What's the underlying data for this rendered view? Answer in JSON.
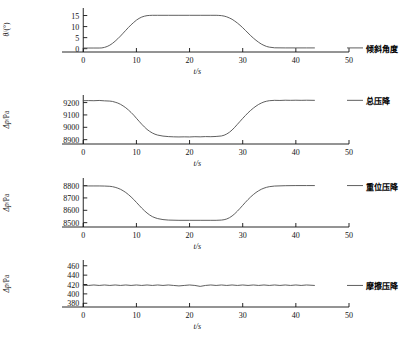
{
  "figure": {
    "title": "",
    "axis_x_label": "t/s",
    "x_ticks": [
      0,
      10,
      20,
      30,
      40,
      50
    ],
    "x_range": [
      -4,
      50
    ]
  },
  "panels": [
    {
      "key": "inclination",
      "ylabel_main": "θ",
      "ylabel_unit": "/(°)",
      "ylabel_full": "θ/(°)",
      "series_label": "倾斜角度",
      "y_ticks": [
        0,
        5,
        10,
        15
      ],
      "y_range": [
        -1.5,
        17.5
      ],
      "xlabel": "t/s"
    },
    {
      "key": "total-pressure-drop",
      "ylabel_main": "Δp",
      "ylabel_unit": "/Pa",
      "ylabel_full": "Δp/Pa",
      "series_label": "总压降",
      "y_ticks": [
        8900,
        9000,
        9100,
        9200
      ],
      "y_range": [
        8865,
        9245
      ],
      "xlabel": "t/s"
    },
    {
      "key": "elevation-pressure-drop",
      "ylabel_main": "Δp",
      "ylabel_unit": "/Pa",
      "ylabel_full": "Δp/Pa",
      "series_label": "重位压降",
      "y_ticks": [
        8500,
        8600,
        8700,
        8800
      ],
      "y_range": [
        8465,
        8845
      ],
      "xlabel": "t/s"
    },
    {
      "key": "friction-pressure-drop",
      "ylabel_main": "Δp",
      "ylabel_unit": "/Pa",
      "ylabel_full": "Δp/Pa",
      "series_label": "摩擦压降",
      "y_ticks": [
        380,
        400,
        420,
        440,
        460
      ],
      "y_range": [
        372,
        468
      ],
      "xlabel": "t/s"
    }
  ],
  "chart_data": [
    {
      "type": "line",
      "title": "倾斜角度",
      "xlabel": "t/s",
      "ylabel": "θ/(°)",
      "xlim": [
        -4,
        50
      ],
      "ylim": [
        -1.5,
        17.5
      ],
      "xticks": [
        0,
        10,
        20,
        30,
        40,
        50
      ],
      "yticks": [
        0,
        5,
        10,
        15
      ],
      "grid": false,
      "legend": "right-outside",
      "series": [
        {
          "name": "倾斜角度",
          "color": "#4d4d4d",
          "x": [
            0,
            1,
            2,
            3,
            3.5,
            4,
            4.5,
            5,
            5.5,
            6,
            6.5,
            7,
            7.5,
            8,
            8.5,
            9,
            9.5,
            10,
            10.5,
            11,
            11.5,
            12,
            12.5,
            13,
            14,
            16,
            18,
            20,
            22,
            24,
            25,
            25.5,
            26,
            26.5,
            27,
            27.5,
            28,
            28.5,
            29,
            29.5,
            30,
            30.5,
            31,
            31.5,
            32,
            32.5,
            33,
            33.5,
            34,
            34.5,
            35,
            36,
            38,
            40,
            42,
            43.5
          ],
          "y": [
            0.3,
            0.3,
            0.3,
            0.3,
            0.35,
            0.6,
            1.0,
            1.6,
            2.4,
            3.4,
            4.5,
            5.7,
            7.0,
            8.3,
            9.6,
            10.8,
            11.9,
            12.9,
            13.7,
            14.3,
            14.7,
            14.95,
            15.05,
            15.1,
            15.1,
            15.1,
            15.1,
            15.1,
            15.1,
            15.1,
            15.1,
            15.05,
            14.95,
            14.75,
            14.4,
            13.9,
            13.3,
            12.5,
            11.6,
            10.6,
            9.5,
            8.3,
            7.1,
            5.9,
            4.8,
            3.8,
            2.9,
            2.1,
            1.5,
            1.0,
            0.7,
            0.4,
            0.35,
            0.35,
            0.35,
            0.35
          ]
        }
      ]
    },
    {
      "type": "line",
      "title": "总压降",
      "xlabel": "t/s",
      "ylabel": "Δp/Pa",
      "xlim": [
        -4,
        50
      ],
      "ylim": [
        8865,
        9245
      ],
      "xticks": [
        0,
        10,
        20,
        30,
        40,
        50
      ],
      "yticks": [
        8900,
        9000,
        9100,
        9200
      ],
      "grid": false,
      "legend": "right-outside",
      "series": [
        {
          "name": "总压降",
          "color": "#4d4d4d",
          "x": [
            0,
            1,
            2,
            3,
            4,
            5,
            5.5,
            6,
            6.5,
            7,
            7.5,
            8,
            8.5,
            9,
            9.5,
            10,
            10.5,
            11,
            11.5,
            12,
            12.5,
            13,
            13.5,
            14,
            15,
            16,
            17,
            18,
            19,
            20,
            21,
            22,
            23,
            24,
            25,
            26,
            26.5,
            27,
            27.5,
            28,
            28.5,
            29,
            29.5,
            30,
            30.5,
            31,
            31.5,
            32,
            32.5,
            33,
            33.5,
            34,
            34.5,
            35,
            36,
            37,
            38,
            39,
            40,
            41,
            42,
            43.5
          ],
          "y": [
            9215,
            9216,
            9215,
            9217,
            9214,
            9212,
            9209,
            9203,
            9196,
            9186,
            9173,
            9158,
            9140,
            9120,
            9098,
            9073,
            9049,
            9025,
            9003,
            8983,
            8967,
            8954,
            8944,
            8937,
            8929,
            8925,
            8923,
            8922,
            8923,
            8922,
            8924,
            8923,
            8925,
            8924,
            8926,
            8930,
            8936,
            8946,
            8960,
            8978,
            9000,
            9024,
            9048,
            9072,
            9095,
            9117,
            9137,
            9155,
            9171,
            9185,
            9196,
            9205,
            9211,
            9215,
            9218,
            9217,
            9219,
            9218,
            9219,
            9218,
            9219,
            9218
          ]
        }
      ]
    },
    {
      "type": "line",
      "title": "重位压降",
      "xlabel": "t/s",
      "ylabel": "Δp/Pa",
      "xlim": [
        -4,
        50
      ],
      "ylim": [
        8465,
        8845
      ],
      "xticks": [
        0,
        10,
        20,
        30,
        40,
        50
      ],
      "yticks": [
        8500,
        8600,
        8700,
        8800
      ],
      "grid": false,
      "legend": "right-outside",
      "series": [
        {
          "name": "重位压降",
          "color": "#4d4d4d",
          "x": [
            0,
            1,
            2,
            3,
            4,
            5,
            5.5,
            6,
            6.5,
            7,
            7.5,
            8,
            8.5,
            9,
            9.5,
            10,
            10.5,
            11,
            11.5,
            12,
            12.5,
            13,
            13.5,
            14,
            15,
            16,
            18,
            20,
            22,
            24,
            25,
            26,
            26.5,
            27,
            27.5,
            28,
            28.5,
            29,
            29.5,
            30,
            30.5,
            31,
            31.5,
            32,
            32.5,
            33,
            33.5,
            34,
            34.5,
            35,
            36,
            38,
            40,
            42,
            43.5
          ],
          "y": [
            8797,
            8797,
            8797,
            8797,
            8796,
            8794,
            8791,
            8786,
            8779,
            8770,
            8758,
            8744,
            8727,
            8708,
            8687,
            8664,
            8641,
            8618,
            8597,
            8578,
            8562,
            8549,
            8540,
            8533,
            8525,
            8521,
            8519,
            8519,
            8519,
            8519,
            8519,
            8521,
            8524,
            8530,
            8540,
            8554,
            8572,
            8593,
            8616,
            8640,
            8664,
            8687,
            8708,
            8727,
            8744,
            8758,
            8770,
            8779,
            8786,
            8791,
            8796,
            8799,
            8800,
            8800,
            8800
          ]
        }
      ]
    },
    {
      "type": "line",
      "title": "摩擦压降",
      "xlabel": "t/s",
      "ylabel": "Δp/Pa",
      "xlim": [
        -4,
        50
      ],
      "ylim": [
        372,
        468
      ],
      "xticks": [
        0,
        10,
        20,
        30,
        40,
        50
      ],
      "yticks": [
        380,
        400,
        420,
        440,
        460
      ],
      "grid": false,
      "legend": "right-outside",
      "series": [
        {
          "name": "摩擦压降",
          "color": "#4d4d4d",
          "x": [
            0,
            1,
            2,
            3,
            4,
            5,
            6,
            7,
            8,
            9,
            10,
            11,
            12,
            13,
            14,
            15,
            16,
            17,
            18,
            19,
            20,
            21,
            22,
            23,
            24,
            25,
            26,
            27,
            28,
            29,
            30,
            31,
            32,
            33,
            34,
            35,
            36,
            37,
            38,
            39,
            40,
            41,
            42,
            43.5
          ],
          "y": [
            418,
            418,
            419,
            418,
            419,
            418,
            419,
            418,
            419,
            418,
            419,
            418,
            419,
            418,
            419,
            418,
            419,
            418,
            417,
            418,
            419,
            418,
            416,
            418,
            419,
            418,
            419,
            418,
            419,
            418,
            419,
            418,
            419,
            418,
            419,
            418,
            419,
            418,
            419,
            418,
            419,
            418,
            419,
            418
          ]
        }
      ]
    }
  ]
}
